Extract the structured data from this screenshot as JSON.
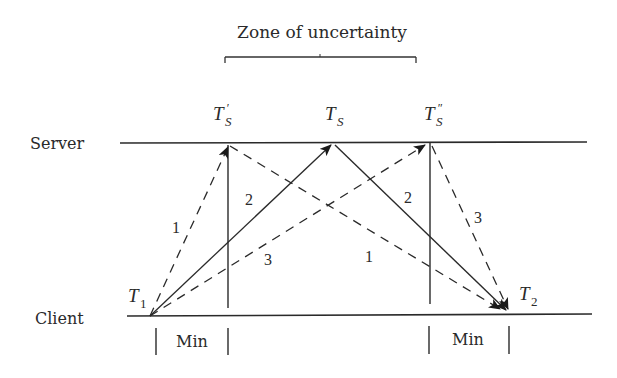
{
  "diagram": {
    "title": "Zone of uncertainty",
    "timelines": {
      "server_label": "Server",
      "client_label": "Client"
    },
    "time_points": {
      "t1": {
        "base": "T",
        "sub": "1"
      },
      "t2": {
        "base": "T",
        "sub": "2"
      },
      "ts_prime": {
        "base": "T",
        "sub": "S",
        "mark": "′"
      },
      "ts": {
        "base": "T",
        "sub": "S"
      },
      "ts_dprime": {
        "base": "T",
        "sub": "S",
        "mark": "″"
      }
    },
    "messages": [
      {
        "id": "request-1",
        "label": "1",
        "style": "dashed",
        "from": "T1",
        "to": "T'S"
      },
      {
        "id": "request-2",
        "label": "2",
        "style": "solid",
        "from": "T1",
        "to": "TS"
      },
      {
        "id": "request-3",
        "label": "3",
        "style": "dashed",
        "from": "T1",
        "to": "T''S"
      },
      {
        "id": "reply-1",
        "label": "1",
        "style": "dashed",
        "from": "T'S",
        "to": "T2"
      },
      {
        "id": "reply-2",
        "label": "2",
        "style": "solid",
        "from": "TS",
        "to": "T2"
      },
      {
        "id": "reply-3",
        "label": "3",
        "style": "dashed",
        "from": "T''S",
        "to": "T2"
      }
    ],
    "min_labels": [
      "Min",
      "Min"
    ],
    "line_color": "#2a2a2a"
  }
}
